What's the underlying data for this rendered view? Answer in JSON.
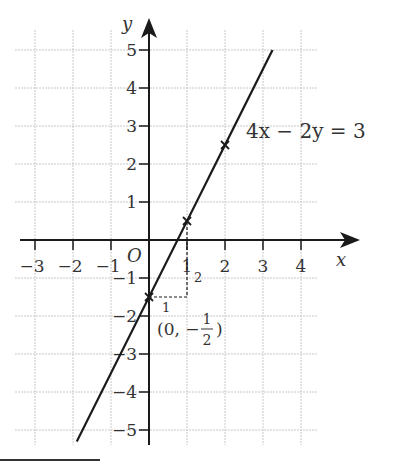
{
  "chart_data": {
    "type": "line",
    "title": "",
    "xlabel": "x",
    "ylabel": "y",
    "xlim": [
      -3.5,
      4.5
    ],
    "ylim": [
      -5.3,
      5.5
    ],
    "grid": true,
    "origin_label": "O",
    "x_ticks": [
      -3,
      -2,
      -1,
      1,
      2,
      3,
      4
    ],
    "x_tick_labels": [
      "−3",
      "−2",
      "−1",
      "1",
      "2",
      "3",
      "4"
    ],
    "y_ticks": [
      5,
      4,
      3,
      2,
      1,
      -1,
      -2,
      -3,
      -4,
      -5
    ],
    "y_tick_labels": [
      "5",
      "4",
      "3",
      "2",
      "1",
      "−1",
      "−2",
      "−3",
      "−4",
      "−5"
    ],
    "series": [
      {
        "name": "4x − 2y = 3",
        "equation": "4x − 2y = 3",
        "x": [
          -1.9,
          3.25
        ],
        "y": [
          -5.3,
          5
        ]
      }
    ],
    "marked_points": [
      {
        "x": 0,
        "y": -1.5
      },
      {
        "x": 1,
        "y": 0.5
      },
      {
        "x": 2,
        "y": 2.5
      }
    ],
    "annotations": {
      "equation_label": "4x − 2y = 3",
      "point_label": "(0, −",
      "point_label_num": "1",
      "point_label_den": "2",
      "point_label_close": ")",
      "run_label": "1",
      "rise_label": "2"
    }
  }
}
